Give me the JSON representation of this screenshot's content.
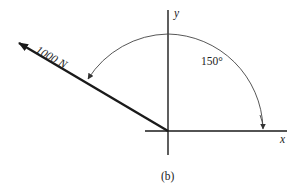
{
  "diagram": {
    "type": "force-vector",
    "force": {
      "label": "1000 N",
      "magnitude": 1000,
      "unit": "N",
      "angle_deg": 150
    },
    "angle_label": "150°",
    "axes": {
      "x_label": "x",
      "y_label": "y"
    },
    "caption": "(b)",
    "colors": {
      "line": "#1a1a1a",
      "arc": "#444444",
      "text": "#222222"
    }
  }
}
